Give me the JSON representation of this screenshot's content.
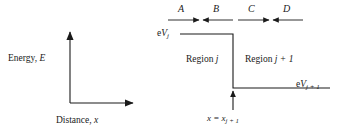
{
  "figure": {
    "type": "potential-step-diagram",
    "background_color": "#ffffff",
    "line_color": "#1a1a1a",
    "text_color": "#1a1a1a"
  },
  "axes": {
    "y_axis_label": "Energy, ",
    "y_axis_symbol": "E",
    "x_axis_label": "Distance, ",
    "x_axis_symbol": "x",
    "y_axis": {
      "x": 70,
      "y_bottom": 103,
      "y_top": 32
    },
    "x_axis": {
      "y": 103,
      "x_left": 70,
      "x_right": 133
    }
  },
  "waves": [
    {
      "name": "A",
      "label": "A",
      "direction": "right",
      "x_start": 168,
      "x_end": 199,
      "y": 20,
      "label_x": 178,
      "label_y": 4
    },
    {
      "name": "B",
      "label": "B",
      "direction": "left",
      "x_start": 233,
      "x_end": 203,
      "y": 20,
      "label_x": 213,
      "label_y": 4
    },
    {
      "name": "C",
      "label": "C",
      "direction": "right",
      "x_start": 238,
      "x_end": 269,
      "y": 20,
      "label_x": 248,
      "label_y": 4
    },
    {
      "name": "D",
      "label": "D",
      "direction": "left",
      "x_start": 303,
      "x_end": 273,
      "y": 20,
      "label_x": 283,
      "label_y": 4
    }
  ],
  "potential": {
    "upper_level": {
      "y": 34,
      "x_start": 180,
      "x_end": 233
    },
    "step_edge": {
      "x": 233,
      "y_top": 34,
      "y_bottom": 88
    },
    "lower_level": {
      "y": 88,
      "x_start": 233,
      "x_end": 330
    },
    "upper_label": {
      "prefix": "e",
      "symbol": "V",
      "subscript": "j",
      "x": 157,
      "y": 30
    },
    "lower_label": {
      "prefix": "e",
      "symbol": "V",
      "subscript": "j + 1",
      "x": 296,
      "y": 81
    }
  },
  "regions": [
    {
      "name": "region-j",
      "prefix": "Region ",
      "symbol": "j",
      "x": 186,
      "y": 55
    },
    {
      "name": "region-j-plus-1",
      "prefix": "Region ",
      "symbol": "j + 1",
      "x": 245,
      "y": 55
    }
  ],
  "position_marker": {
    "arrow": {
      "x": 233,
      "y_start": 110,
      "y_end": 90,
      "direction": "up"
    },
    "label_prefix": "x = x",
    "label_subscript": "j + 1",
    "label_x": 207,
    "label_y": 114
  }
}
